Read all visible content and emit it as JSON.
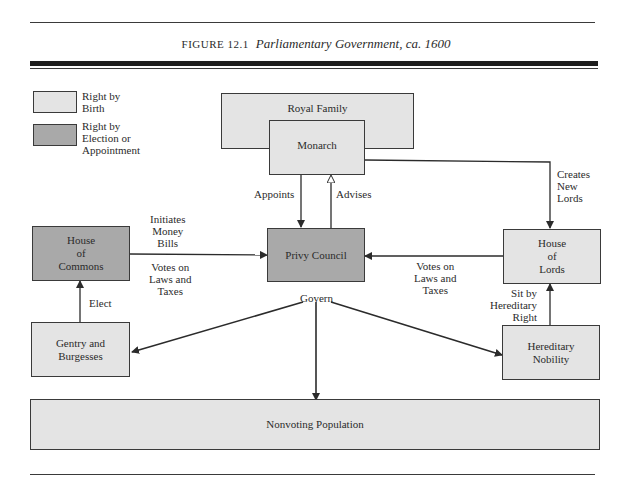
{
  "caption": {
    "label": "FIGURE 12.1",
    "title": "Parliamentary Government, ca. 1600"
  },
  "legend": [
    {
      "label_line1": "Right by",
      "label_line2": "Birth",
      "label_line3": "",
      "fill": "#e4e4e4"
    },
    {
      "label_line1": "Right by",
      "label_line2": "Election or",
      "label_line3": "Appointment",
      "fill": "#a9a9a9"
    }
  ],
  "nodes": {
    "royal_family": "Royal Family",
    "monarch": "Monarch",
    "privy_council": "Privy Council",
    "house_of_commons": [
      "House",
      "of",
      "Commons"
    ],
    "house_of_lords": [
      "House",
      "of",
      "Lords"
    ],
    "gentry_and_burgesses": [
      "Gentry and",
      "Burgesses"
    ],
    "hereditary_nobility": [
      "Hereditary",
      "Nobility"
    ],
    "nonvoting_population": "Nonvoting Population"
  },
  "edge_labels": {
    "appoints": "Appoints",
    "advises": "Advises",
    "creates_new_lords": [
      "Creates",
      "New",
      "Lords"
    ],
    "initiates_money_bills": [
      "Initiates",
      "Money",
      "Bills"
    ],
    "commons_votes": [
      "Votes on",
      "Laws and",
      "Taxes"
    ],
    "lords_votes": [
      "Votes on",
      "Laws and",
      "Taxes"
    ],
    "elect": "Elect",
    "govern": "Govern",
    "sit_by_hereditary_right": [
      "Sit by",
      "Hereditary",
      "Right"
    ]
  },
  "colors": {
    "birth_fill": "#e4e4e4",
    "election_fill": "#a9a9a9",
    "line": "#2b2b2b"
  }
}
